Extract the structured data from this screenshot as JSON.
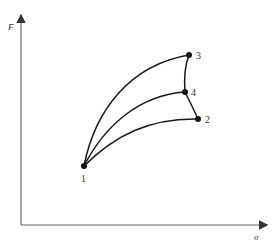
{
  "diagram": {
    "axes": {
      "y_label": "F̄",
      "x_label": "σ"
    },
    "points": [
      {
        "id": "1",
        "label": "1",
        "x": 84,
        "y": 166
      },
      {
        "id": "2",
        "label": "2",
        "x": 198,
        "y": 119
      },
      {
        "id": "3",
        "label": "3",
        "x": 189,
        "y": 55
      },
      {
        "id": "4",
        "label": "4",
        "x": 185,
        "y": 92
      }
    ],
    "curves": [
      {
        "from": "1",
        "to": "3"
      },
      {
        "from": "1",
        "to": "4"
      },
      {
        "from": "1",
        "to": "2"
      },
      {
        "from": "3",
        "to": "4"
      },
      {
        "from": "4",
        "to": "2"
      }
    ],
    "colors": {
      "line": "#1a1a1a",
      "axis": "#555555"
    }
  }
}
